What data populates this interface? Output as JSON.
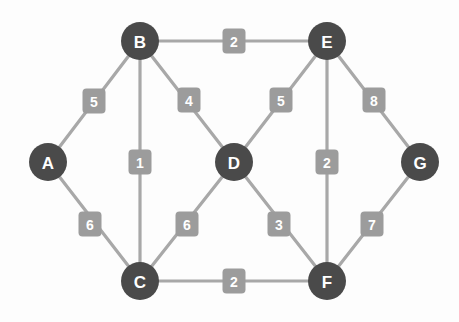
{
  "chart_data": {
    "type": "diagram",
    "diagram_kind": "weighted-undirected-graph",
    "title": "",
    "background_color": "#fdfdfd",
    "node_color": "#4a4a4a",
    "node_label_color": "#ffffff",
    "edge_color": "#a8a8a8",
    "weight_badge_color": "#9c9c9c",
    "weight_label_color": "#ffffff",
    "node_radius": 19,
    "nodes": [
      {
        "id": "A",
        "label": "A",
        "x": 48,
        "y": 162
      },
      {
        "id": "B",
        "label": "B",
        "x": 140,
        "y": 41
      },
      {
        "id": "C",
        "label": "C",
        "x": 140,
        "y": 281
      },
      {
        "id": "D",
        "label": "D",
        "x": 234,
        "y": 162
      },
      {
        "id": "E",
        "label": "E",
        "x": 327,
        "y": 41
      },
      {
        "id": "F",
        "label": "F",
        "x": 327,
        "y": 281
      },
      {
        "id": "G",
        "label": "G",
        "x": 420,
        "y": 162
      }
    ],
    "edges": [
      {
        "source": "A",
        "target": "B",
        "weight": 5,
        "label": "5",
        "lx": 94,
        "ly": 101
      },
      {
        "source": "A",
        "target": "C",
        "weight": 6,
        "label": "6",
        "lx": 90,
        "ly": 224
      },
      {
        "source": "B",
        "target": "E",
        "weight": 2,
        "label": "2",
        "lx": 234,
        "ly": 41
      },
      {
        "source": "B",
        "target": "C",
        "weight": 1,
        "label": "1",
        "lx": 140,
        "ly": 162
      },
      {
        "source": "B",
        "target": "D",
        "weight": 4,
        "label": "4",
        "lx": 189,
        "ly": 100
      },
      {
        "source": "C",
        "target": "D",
        "weight": 6,
        "label": "6",
        "lx": 187,
        "ly": 224
      },
      {
        "source": "C",
        "target": "F",
        "weight": 2,
        "label": "2",
        "lx": 234,
        "ly": 281
      },
      {
        "source": "D",
        "target": "E",
        "weight": 5,
        "label": "5",
        "lx": 281,
        "ly": 100
      },
      {
        "source": "D",
        "target": "F",
        "weight": 3,
        "label": "3",
        "lx": 279,
        "ly": 224
      },
      {
        "source": "E",
        "target": "F",
        "weight": 2,
        "label": "2",
        "lx": 327,
        "ly": 162
      },
      {
        "source": "E",
        "target": "G",
        "weight": 8,
        "label": "8",
        "lx": 374,
        "ly": 100
      },
      {
        "source": "F",
        "target": "G",
        "weight": 7,
        "label": "7",
        "lx": 372,
        "ly": 224
      }
    ]
  }
}
